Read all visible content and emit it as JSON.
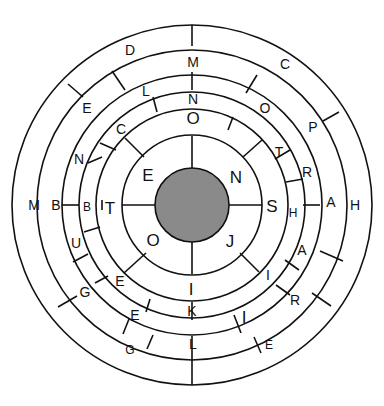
{
  "diagram": {
    "type": "concentric-word-wheel",
    "center": {
      "x": 192,
      "y": 205
    },
    "hub": {
      "radius": 37,
      "color": "#8a8a8a"
    },
    "ring_radii": [
      70,
      96,
      113,
      130,
      155,
      180
    ],
    "stroke_color": "#111111",
    "labels": [
      {
        "t": "E",
        "x": 148,
        "y": 175,
        "s": "lg"
      },
      {
        "t": "N",
        "x": 236,
        "y": 177,
        "s": "lg"
      },
      {
        "t": "O",
        "x": 153,
        "y": 240,
        "s": "lg"
      },
      {
        "t": "J",
        "x": 230,
        "y": 241,
        "s": "lg"
      },
      {
        "t": "O",
        "x": 193,
        "y": 118,
        "s": "lg"
      },
      {
        "t": "C",
        "x": 121,
        "y": 129,
        "s": "md"
      },
      {
        "t": "T",
        "x": 279,
        "y": 152,
        "s": "md"
      },
      {
        "t": "T",
        "x": 110,
        "y": 208,
        "s": "lg"
      },
      {
        "t": "S",
        "x": 272,
        "y": 206,
        "s": "lg"
      },
      {
        "t": "E",
        "x": 120,
        "y": 281,
        "s": "md"
      },
      {
        "t": "I",
        "x": 268,
        "y": 275,
        "s": "md"
      },
      {
        "t": "I",
        "x": 191,
        "y": 289,
        "s": "lg"
      },
      {
        "t": "N",
        "x": 193,
        "y": 99,
        "s": "md"
      },
      {
        "t": "N",
        "x": 79,
        "y": 159,
        "s": "md"
      },
      {
        "t": "B",
        "x": 87,
        "y": 207,
        "s": "sm"
      },
      {
        "t": "H",
        "x": 293,
        "y": 213,
        "s": "sm"
      },
      {
        "t": "K",
        "x": 192,
        "y": 311,
        "s": "md"
      },
      {
        "t": "E",
        "x": 135,
        "y": 315,
        "s": "md"
      },
      {
        "t": "I",
        "x": 244,
        "y": 317,
        "s": "lg"
      },
      {
        "t": "L",
        "x": 146,
        "y": 91,
        "s": "md"
      },
      {
        "t": "O",
        "x": 265,
        "y": 108,
        "s": "md"
      },
      {
        "t": "R",
        "x": 307,
        "y": 172,
        "s": "md"
      },
      {
        "t": "U",
        "x": 76,
        "y": 243,
        "s": "md"
      },
      {
        "t": "L",
        "x": 193,
        "y": 344,
        "s": "md"
      },
      {
        "t": "R",
        "x": 295,
        "y": 300,
        "s": "md"
      },
      {
        "t": "M",
        "x": 193,
        "y": 62,
        "s": "md"
      },
      {
        "t": "E",
        "x": 87,
        "y": 108,
        "s": "md"
      },
      {
        "t": "P",
        "x": 313,
        "y": 127,
        "s": "md"
      },
      {
        "t": "B",
        "x": 56,
        "y": 205,
        "s": "md"
      },
      {
        "t": "A",
        "x": 331,
        "y": 202,
        "s": "md"
      },
      {
        "t": "A",
        "x": 302,
        "y": 250,
        "s": "md"
      },
      {
        "t": "G",
        "x": 85,
        "y": 292,
        "s": "md"
      },
      {
        "t": "E",
        "x": 269,
        "y": 345,
        "s": "sm"
      },
      {
        "t": "G",
        "x": 130,
        "y": 350,
        "s": "sm"
      },
      {
        "t": "D",
        "x": 130,
        "y": 50,
        "s": "md"
      },
      {
        "t": "C",
        "x": 285,
        "y": 64,
        "s": "md"
      },
      {
        "t": "M",
        "x": 34,
        "y": 205,
        "s": "md"
      },
      {
        "t": "H",
        "x": 355,
        "y": 205,
        "s": "md"
      }
    ],
    "dividers": [
      [
        192,
        168,
        192,
        136
      ],
      [
        192,
        242,
        192,
        274
      ],
      [
        155,
        205,
        122,
        205
      ],
      [
        229,
        205,
        262,
        205
      ],
      [
        192,
        25,
        192,
        46
      ],
      [
        192,
        72,
        192,
        90
      ],
      [
        192,
        302,
        192,
        320
      ],
      [
        192,
        336,
        192,
        352
      ],
      [
        192,
        352,
        192,
        385
      ],
      [
        125,
        138,
        144,
        157
      ],
      [
        243,
        157,
        262,
        140
      ],
      [
        124,
        273,
        146,
        253
      ],
      [
        240,
        253,
        259,
        272
      ],
      [
        102,
        200,
        102,
        210
      ],
      [
        62,
        205,
        79,
        205
      ],
      [
        303,
        205,
        320,
        205
      ],
      [
        68,
        84,
        83,
        97
      ],
      [
        112,
        71,
        125,
        90
      ],
      [
        257,
        75,
        246,
        93
      ],
      [
        339,
        112,
        323,
        121
      ],
      [
        100,
        143,
        116,
        150
      ],
      [
        102,
        157,
        88,
        163
      ],
      [
        233,
        117,
        228,
        130
      ],
      [
        153,
        97,
        157,
        112
      ],
      [
        275,
        159,
        290,
        150
      ],
      [
        286,
        182,
        303,
        179
      ],
      [
        73,
        262,
        88,
        254
      ],
      [
        84,
        232,
        100,
        227
      ],
      [
        58,
        307,
        77,
        296
      ],
      [
        95,
        283,
        108,
        276
      ],
      [
        285,
        260,
        299,
        270
      ],
      [
        276,
        285,
        290,
        295
      ],
      [
        320,
        251,
        343,
        261
      ],
      [
        312,
        293,
        331,
        306
      ],
      [
        123,
        334,
        129,
        319
      ],
      [
        234,
        315,
        241,
        333
      ],
      [
        150,
        299,
        146,
        312
      ],
      [
        254,
        337,
        261,
        353
      ],
      [
        147,
        349,
        153,
        335
      ]
    ]
  }
}
